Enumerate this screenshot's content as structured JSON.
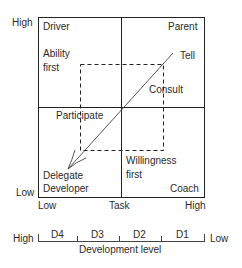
{
  "diagram": {
    "y_axis": {
      "high": "High",
      "low": "Low"
    },
    "x_axis": {
      "low": "Low",
      "mid": "Task",
      "high": "High"
    },
    "quadrants": {
      "top_left": "Driver",
      "top_right": "Parent",
      "bottom_left": "Developer",
      "bottom_right": "Coach"
    },
    "annotations": {
      "ability_first_1": "Ability",
      "ability_first_2": "first",
      "tell": "Tell",
      "consult": "Consult",
      "participate": "Participate",
      "delegate": "Delegate",
      "willingness_1": "Willingness",
      "willingness_2": "first"
    },
    "development_scale": {
      "left": "High",
      "right": "Low",
      "levels": [
        "D4",
        "D3",
        "D2",
        "D1"
      ],
      "title": "Development level"
    },
    "colors": {
      "line": "#222222",
      "text": "#2a2a2a"
    }
  }
}
